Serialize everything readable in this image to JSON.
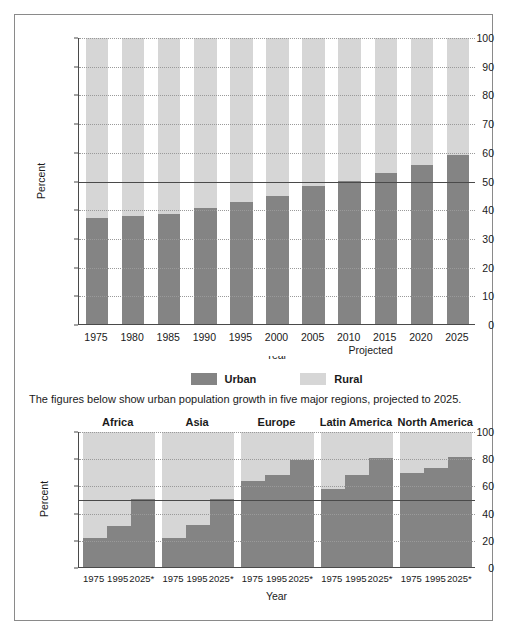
{
  "figure": {
    "caption": "The figures below show urban population growth in five major regions, projected to 2025.",
    "legend": [
      {
        "label": "Urban",
        "color": "#848484",
        "key": "urban"
      },
      {
        "label": "Rural",
        "color": "#d6d6d6",
        "key": "rural"
      }
    ],
    "projected_label": "Projected"
  },
  "chart_data": [
    {
      "type": "bar",
      "stacked": true,
      "title": "",
      "xlabel": "Year",
      "ylabel": "Percent",
      "ylim": [
        0,
        100
      ],
      "yticks": [
        0,
        10,
        20,
        30,
        40,
        50,
        60,
        70,
        80,
        90,
        100
      ],
      "ytick_labels": [
        "0",
        "10",
        "20",
        "30",
        "40",
        "50",
        "60",
        "70",
        "80",
        "90",
        "100"
      ],
      "grid": true,
      "legend_position": "bottom",
      "categories": [
        "1975",
        "1980",
        "1985",
        "1990",
        "1995",
        "2000",
        "2005",
        "2010",
        "2015",
        "2020",
        "2025"
      ],
      "series": [
        {
          "name": "Urban",
          "color": "#848484",
          "values": [
            37,
            37.5,
            38.5,
            40.5,
            42.5,
            44.5,
            48,
            50,
            52.5,
            55.5,
            59
          ]
        },
        {
          "name": "Rural",
          "color": "#d6d6d6",
          "values": [
            63,
            62.5,
            61.5,
            59.5,
            57.5,
            55.5,
            52,
            50,
            47.5,
            44.5,
            41
          ]
        }
      ],
      "annotations": [
        {
          "text": "Projected",
          "from": "2000",
          "to": "2025"
        }
      ]
    },
    {
      "type": "bar",
      "stacked": true,
      "title": "",
      "xlabel": "Year",
      "ylabel": "Percent",
      "ylim": [
        0,
        100
      ],
      "yticks": [
        0,
        20,
        40,
        60,
        80,
        100
      ],
      "ytick_labels": [
        "0",
        "20",
        "40",
        "60",
        "80",
        "100"
      ],
      "grid": true,
      "groups": [
        {
          "name": "Africa",
          "categories": [
            "1975",
            "1995",
            "2025*"
          ],
          "urban": [
            21,
            30,
            50
          ],
          "rural": [
            79,
            70,
            50
          ]
        },
        {
          "name": "Asia",
          "categories": [
            "1975",
            "1995",
            "2025*"
          ],
          "urban": [
            21,
            31,
            50
          ],
          "rural": [
            79,
            69,
            50
          ]
        },
        {
          "name": "Europe",
          "categories": [
            "1975",
            "1995",
            "2025*"
          ],
          "urban": [
            63,
            68,
            79
          ],
          "rural": [
            37,
            32,
            21
          ]
        },
        {
          "name": "Latin America",
          "categories": [
            "1975",
            "1995",
            "2025*"
          ],
          "urban": [
            57,
            68,
            80
          ],
          "rural": [
            43,
            32,
            20
          ]
        },
        {
          "name": "North America",
          "categories": [
            "1975",
            "1995",
            "2025*"
          ],
          "urban": [
            69,
            73,
            81
          ],
          "rural": [
            31,
            27,
            19
          ]
        }
      ]
    }
  ]
}
